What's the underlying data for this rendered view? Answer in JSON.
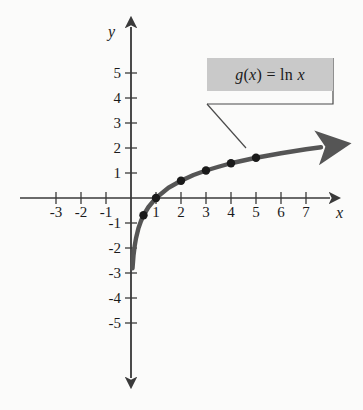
{
  "figure": {
    "background_color": "#fbfbfa",
    "curve_color": "#555555",
    "point_color": "#1a1a1a",
    "axis_color": "#3a3a3a",
    "callout_background": "#c9c9c9"
  },
  "callout": {
    "label": "g(x) = ln x",
    "function_name": "g",
    "variable": "x",
    "expression": "ln x"
  },
  "axes": {
    "x_name": "x",
    "y_name": "y",
    "x_ticks": [
      "-3",
      "-2",
      "-1",
      "1",
      "2",
      "3",
      "4",
      "5",
      "6",
      "7"
    ],
    "y_ticks": [
      "5",
      "4",
      "3",
      "2",
      "1",
      "-1",
      "-2",
      "-3",
      "-4",
      "-5"
    ]
  },
  "chart_data": {
    "type": "line",
    "title": "",
    "subtitle": "",
    "xlabel": "x",
    "ylabel": "y",
    "xlim": [
      -3.8,
      8.2
    ],
    "ylim": [
      -5.8,
      5.8
    ],
    "grid": false,
    "legend_position": "inside-top-right",
    "annotations": [
      {
        "text": "g(x) = ln x",
        "type": "callout-box",
        "anchor_x": 5.6,
        "anchor_y": 4.3,
        "leader_to_x": 4.6,
        "leader_to_y": 1.55
      }
    ],
    "series": [
      {
        "name": "g(x) = ln x",
        "type": "line",
        "color": "#555555",
        "arrow_end": true,
        "asymptote": "x = 0",
        "x": [
          0.06,
          0.1,
          0.15,
          0.2,
          0.3,
          0.4,
          0.5,
          0.7,
          1.0,
          1.5,
          2.0,
          2.5,
          3.0,
          3.5,
          4.0,
          4.5,
          5.0,
          5.5,
          6.0,
          6.5,
          7.0,
          7.6
        ],
        "y": [
          -2.81,
          -2.3,
          -1.9,
          -1.61,
          -1.2,
          -0.92,
          -0.69,
          -0.36,
          0.0,
          0.41,
          0.69,
          0.92,
          1.1,
          1.25,
          1.39,
          1.5,
          1.61,
          1.7,
          1.79,
          1.87,
          1.95,
          2.03
        ]
      },
      {
        "name": "marked points",
        "type": "scatter",
        "color": "#1a1a1a",
        "points": [
          {
            "x": 0.5,
            "y": -0.69
          },
          {
            "x": 1,
            "y": 0
          },
          {
            "x": 2,
            "y": 0.69
          },
          {
            "x": 3,
            "y": 1.1
          },
          {
            "x": 4,
            "y": 1.39
          },
          {
            "x": 5,
            "y": 1.61
          }
        ]
      }
    ]
  }
}
